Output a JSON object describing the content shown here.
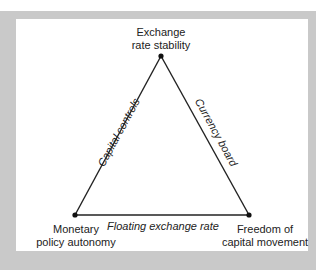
{
  "diagram": {
    "type": "impossible-trinity",
    "vertices": {
      "top": {
        "line1": "Exchange",
        "line2": "rate stability"
      },
      "bottom_left": {
        "line1": "Monetary",
        "line2": "policy autonomy"
      },
      "bottom_right": {
        "line1": "Freedom of",
        "line2": "capital movement"
      }
    },
    "edges": {
      "left": "Capital controls",
      "right": "Currency board",
      "bottom": "Floating exchange rate"
    },
    "colors": {
      "frame": "#c9c9c9",
      "panel": "#ffffff",
      "line": "#222222"
    }
  }
}
